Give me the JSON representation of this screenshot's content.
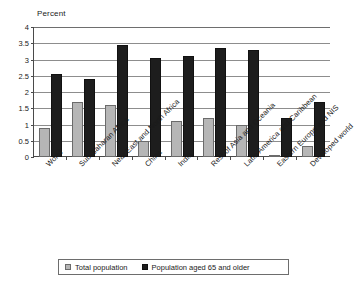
{
  "chart_data": {
    "type": "bar",
    "title": "",
    "subtitle": "",
    "xlabel": "",
    "ylabel": "Percent",
    "ylim": [
      0,
      4
    ],
    "yticks": [
      "0",
      "0.5",
      "1",
      "1.5",
      "2",
      "2.5",
      "3",
      "3.5",
      "4"
    ],
    "ytick_values": [
      0,
      0.5,
      1,
      1.5,
      2,
      2.5,
      3,
      3.5,
      4
    ],
    "grid": true,
    "legend_position": "bottom",
    "categories": [
      "World",
      "Sub-Saharan Africa",
      "Near East and North Africa",
      "China",
      "India",
      "Rest of Asia and Oceania",
      "Latin America and Caribbean",
      "Eastern Europe and NIS",
      "Developed world"
    ],
    "series": [
      {
        "name": "Total population",
        "color": "#b6b6b6",
        "values": [
          0.9,
          1.7,
          1.6,
          0.5,
          1.1,
          1.2,
          1.0,
          0.05,
          0.35
        ]
      },
      {
        "name": "Population aged 65 and older",
        "color": "#1d1d1d",
        "values": [
          2.55,
          2.4,
          3.45,
          3.05,
          3.1,
          3.35,
          3.3,
          1.2,
          1.7
        ]
      }
    ]
  },
  "legend": {
    "items": [
      {
        "label": "Total population"
      },
      {
        "label": "Population aged 65 and older"
      }
    ]
  }
}
